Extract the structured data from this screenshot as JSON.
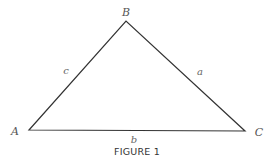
{
  "figure": {
    "caption": "FIGURE 1",
    "vertices": {
      "A": {
        "label": "A",
        "x": 29,
        "y": 130
      },
      "B": {
        "label": "B",
        "x": 126,
        "y": 21
      },
      "C": {
        "label": "C",
        "x": 245,
        "y": 131
      }
    },
    "sides": {
      "a": {
        "label": "a",
        "from": "B",
        "to": "C"
      },
      "b": {
        "label": "b",
        "from": "A",
        "to": "C"
      },
      "c": {
        "label": "c",
        "from": "A",
        "to": "B"
      }
    },
    "stroke_color": "#333333",
    "label_color": "#555555"
  }
}
